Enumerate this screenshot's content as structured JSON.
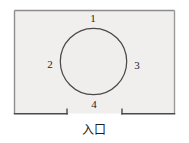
{
  "figure": {
    "kind": "floor-plan-diagram",
    "colors": {
      "room_fill": "#f0efed",
      "room_stroke": "#808080",
      "circle_fill": "#efeeec",
      "circle_stroke": "#4a4a4a",
      "wall_stroke": "#4a4a4a",
      "text": "#1d1d1d",
      "background": "#ffffff"
    },
    "room": {
      "shape": "rectangle",
      "x": 14,
      "y": 10,
      "width": 161,
      "height": 104
    },
    "circle": {
      "cx": 93.5,
      "cy": 61.5,
      "r": 33.5
    },
    "entrance": {
      "gap_left_x": 67,
      "gap_right_x": 122,
      "y": 114,
      "label": "入口"
    },
    "position_labels": [
      {
        "id": "pos-1",
        "text": "1",
        "x": 93,
        "y": 18,
        "side": "top"
      },
      {
        "id": "pos-2",
        "text": "2",
        "x": 50,
        "y": 65,
        "side": "left"
      },
      {
        "id": "pos-3",
        "text": "3",
        "x": 137,
        "y": 66,
        "side": "right"
      },
      {
        "id": "pos-4",
        "text": "4",
        "x": 94,
        "y": 104,
        "side": "bottom"
      }
    ],
    "caption": {
      "text": "入口",
      "x": 94,
      "y": 129
    }
  }
}
